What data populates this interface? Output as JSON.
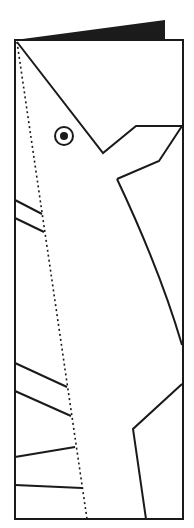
{
  "diagram": {
    "colors": {
      "background": "#ffffff",
      "stroke": "#1a1a1a",
      "fold_fill": "#1c1c1c"
    },
    "card": {
      "x": 15,
      "y": 40,
      "width": 168,
      "height": 479
    },
    "fold_flap": {
      "points": "15,40 165,20 165,40"
    },
    "fold_line_dotted": {
      "x1": 17,
      "y1": 42,
      "x2": 87,
      "y2": 519
    },
    "head_outline": {
      "points": "17,42 103,153 136,126 182,126 159,161 117,179"
    },
    "neck_curve": {
      "d": "M117,179 Q160,270 182,345"
    },
    "eye": {
      "cx": 64,
      "cy": 136,
      "outer_r": 9,
      "inner_r": 4
    },
    "left_spines": [
      {
        "x1": 15,
        "y1": 200,
        "x2": 42,
        "y2": 214
      },
      {
        "x1": 15,
        "y1": 218,
        "x2": 44,
        "y2": 232
      },
      {
        "x1": 15,
        "y1": 363,
        "x2": 67,
        "y2": 387
      },
      {
        "x1": 15,
        "y1": 391,
        "x2": 71,
        "y2": 416
      },
      {
        "x1": 15,
        "y1": 457,
        "x2": 75,
        "y2": 447
      },
      {
        "x1": 15,
        "y1": 485,
        "x2": 82,
        "y2": 488
      }
    ],
    "lower_shape": {
      "points": "182,384 133,429 146,519"
    }
  }
}
